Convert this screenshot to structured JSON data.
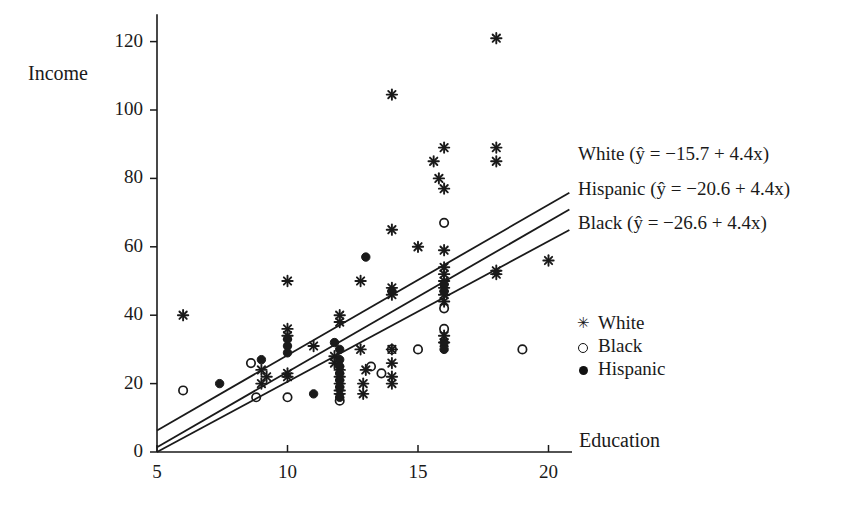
{
  "figure": {
    "background": "#ffffff",
    "ink_color": "#1a1a1a"
  },
  "axes": {
    "x_label": "Education",
    "y_label": "Income",
    "x_ticks": [
      "5",
      "10",
      "15",
      "20"
    ],
    "x_tick_values": [
      5,
      10,
      15,
      20
    ],
    "y_ticks": [
      "0",
      "20",
      "40",
      "60",
      "80",
      "100",
      "120"
    ],
    "y_tick_values": [
      0,
      20,
      40,
      60,
      80,
      100,
      120
    ],
    "xlim": [
      5,
      21.5
    ],
    "ylim": [
      0,
      128
    ]
  },
  "fit_lines": [
    {
      "group": "White",
      "label": "White (ŷ = −15.7 + 4.4x)",
      "intercept": -15.7,
      "slope": 4.4,
      "text_y": 143
    },
    {
      "group": "Hispanic",
      "label": "Hispanic (ŷ = −20.6 + 4.4x)",
      "intercept": -20.6,
      "slope": 4.4,
      "text_y": 178
    },
    {
      "group": "Black",
      "label": "Black (ŷ = −26.6 + 4.4x)",
      "intercept": -26.6,
      "slope": 4.4,
      "text_y": 212
    }
  ],
  "marker_legend": [
    {
      "marker": "asterisk",
      "label": "White",
      "top": 312
    },
    {
      "marker": "circle-open",
      "label": "Black",
      "top": 335
    },
    {
      "marker": "circle-filled",
      "label": "Hispanic",
      "top": 358
    }
  ],
  "chart_data": {
    "type": "scatter",
    "title": "",
    "xlabel": "Education",
    "ylabel": "Income",
    "xlim": [
      5,
      21.5
    ],
    "ylim": [
      0,
      128
    ],
    "grid": false,
    "legend_position": "right",
    "series": [
      {
        "name": "White",
        "marker": "asterisk",
        "points": [
          [
            6,
            40
          ],
          [
            9,
            20
          ],
          [
            9,
            24
          ],
          [
            9.2,
            22
          ],
          [
            10,
            50
          ],
          [
            10,
            36
          ],
          [
            10,
            34
          ],
          [
            10,
            22
          ],
          [
            10,
            23
          ],
          [
            11,
            31
          ],
          [
            11.8,
            28
          ],
          [
            11.8,
            26
          ],
          [
            12,
            38
          ],
          [
            12,
            40
          ],
          [
            12,
            24
          ],
          [
            12,
            22
          ],
          [
            12,
            20
          ],
          [
            12,
            18
          ],
          [
            12,
            17
          ],
          [
            12.8,
            50
          ],
          [
            12.8,
            30
          ],
          [
            12.9,
            20
          ],
          [
            12.9,
            17
          ],
          [
            13,
            24
          ],
          [
            14,
            104.5
          ],
          [
            14,
            65
          ],
          [
            14,
            48
          ],
          [
            14,
            46
          ],
          [
            14,
            30
          ],
          [
            14,
            26
          ],
          [
            14,
            22
          ],
          [
            14,
            20
          ],
          [
            15,
            60
          ],
          [
            15.6,
            85
          ],
          [
            15.8,
            80
          ],
          [
            16,
            89
          ],
          [
            16,
            77
          ],
          [
            16,
            59
          ],
          [
            16,
            54
          ],
          [
            16,
            52
          ],
          [
            16,
            50
          ],
          [
            16,
            48
          ],
          [
            16,
            46
          ],
          [
            16,
            44
          ],
          [
            16,
            34
          ],
          [
            16,
            32
          ],
          [
            18,
            121
          ],
          [
            18,
            89
          ],
          [
            18,
            85
          ],
          [
            18,
            53
          ],
          [
            18,
            52
          ],
          [
            20,
            56
          ]
        ]
      },
      {
        "name": "Black",
        "marker": "circle-open",
        "points": [
          [
            6,
            18
          ],
          [
            8.6,
            26
          ],
          [
            8.8,
            16
          ],
          [
            10,
            16
          ],
          [
            12,
            15
          ],
          [
            13.2,
            25
          ],
          [
            13.6,
            23
          ],
          [
            14,
            30
          ],
          [
            15,
            30
          ],
          [
            16,
            67
          ],
          [
            16,
            42
          ],
          [
            16,
            36
          ],
          [
            19,
            30
          ]
        ]
      },
      {
        "name": "Hispanic",
        "marker": "circle-filled",
        "points": [
          [
            7.4,
            20
          ],
          [
            9,
            27
          ],
          [
            10,
            33
          ],
          [
            10,
            31
          ],
          [
            10,
            29
          ],
          [
            11,
            17
          ],
          [
            11.8,
            32
          ],
          [
            12,
            30
          ],
          [
            12,
            27
          ],
          [
            12,
            25
          ],
          [
            12,
            23
          ],
          [
            12,
            21
          ],
          [
            12,
            19
          ],
          [
            12,
            16
          ],
          [
            13,
            57
          ],
          [
            14,
            47
          ],
          [
            16,
            49
          ],
          [
            16,
            47
          ],
          [
            16,
            32
          ],
          [
            16,
            30
          ]
        ]
      }
    ]
  }
}
